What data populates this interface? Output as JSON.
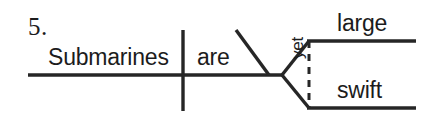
{
  "diagram": {
    "kind": "reed-kellogg-sentence-diagram",
    "item_number": "5.",
    "sentence": "Submarines are large yet swift.",
    "stroke_color": "#262626",
    "text_color": "#1c1c1c",
    "background_color": "#ffffff",
    "subject": {
      "label": "Submarines",
      "role": "subject"
    },
    "verb": {
      "label": "are",
      "role": "linking-verb"
    },
    "conjunction": {
      "label": "yet",
      "role": "coordinating-conjunction",
      "orientation": "vertical-rotated",
      "line_style": "dashed"
    },
    "complements": [
      {
        "label": "large",
        "role": "predicate-adjective"
      },
      {
        "label": "swift",
        "role": "predicate-adjective"
      }
    ],
    "lines": {
      "baseline": {
        "x1": 28,
        "y1": 75,
        "x2": 283,
        "y2": 75
      },
      "subject_verb_divider": {
        "x1": 183,
        "y1": 30,
        "x2": 183,
        "y2": 111
      },
      "predicate_adjective_slant": {
        "x1": 236,
        "y1": 30,
        "x2": 269,
        "y2": 75
      },
      "fork_upper": {
        "x1": 283,
        "y1": 75,
        "x2": 309,
        "y2": 41
      },
      "fork_lower": {
        "x1": 283,
        "y1": 75,
        "x2": 309,
        "y2": 108
      },
      "complement_line_upper": {
        "x1": 307,
        "y1": 41,
        "x2": 416,
        "y2": 41
      },
      "complement_line_lower": {
        "x1": 307,
        "y1": 108,
        "x2": 416,
        "y2": 108
      },
      "conjunction_dashed": {
        "x1": 309,
        "y1": 41,
        "x2": 309,
        "y2": 108
      }
    }
  }
}
